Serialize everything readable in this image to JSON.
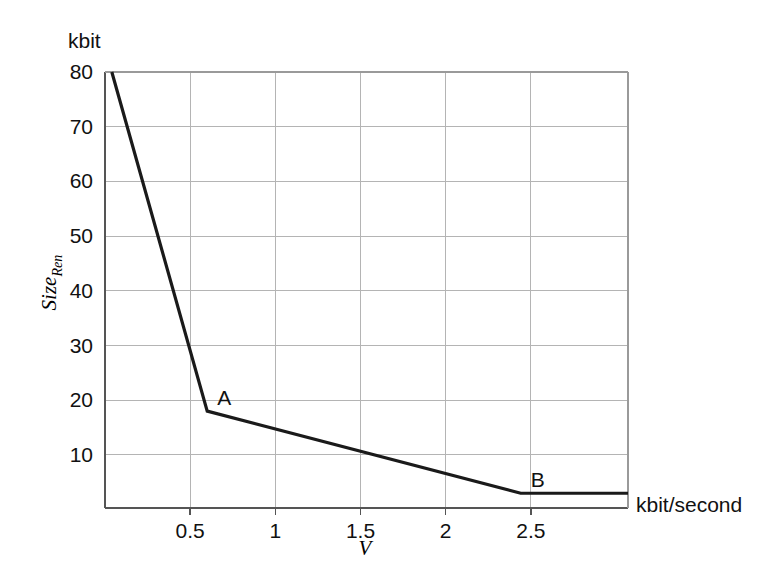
{
  "chart_data": {
    "type": "line",
    "title": "",
    "subtitle": "",
    "xlabel": "V",
    "ylabel": "Size_Ren",
    "x_unit_label": "kbit/second",
    "y_unit_label": "kbit",
    "xlim": [
      0,
      3.07
    ],
    "ylim": [
      0.3,
      80
    ],
    "xticks": [
      0.5,
      1,
      1.5,
      2,
      2.5
    ],
    "xtick_labels": [
      "0.5",
      "1",
      "1.5",
      "2",
      "2.5"
    ],
    "yticks": [
      10,
      20,
      30,
      40,
      50,
      60,
      70,
      80
    ],
    "ytick_labels": [
      "10",
      "20",
      "30",
      "40",
      "50",
      "60",
      "70",
      "80"
    ],
    "grid": true,
    "legend": "none",
    "series": [
      {
        "name": "Size_Ren",
        "x": [
          0.04,
          0.6,
          2.44,
          3.07
        ],
        "values": [
          80,
          18,
          3,
          3
        ]
      }
    ],
    "annotations": [
      {
        "label": "A",
        "x": 0.6,
        "y": 18
      },
      {
        "label": "B",
        "x": 2.44,
        "y": 3
      }
    ],
    "line_color": "#1a1a1a",
    "grid_color": "#b4b4b4",
    "axis_color": "#6e6e6e"
  }
}
